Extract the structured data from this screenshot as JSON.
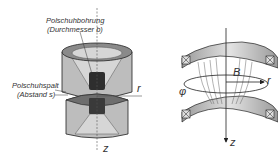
{
  "left_figure": {
    "label_bore_line1": "Polschuhbohrung",
    "label_bore_line2": "(Durchmesser b)",
    "label_gap_line1": "Polschuhspalt",
    "label_gap_line2": "(Abstand s)",
    "axis_r": "r",
    "axis_z": "z"
  },
  "right_figure": {
    "label_B": "B",
    "axis_phi": "φ",
    "axis_r": "r",
    "axis_z": "z"
  },
  "colors": {
    "outer_face": "#bdbdbd",
    "top_face": "#8a8a8a",
    "inner_cone": "#d6d6d6",
    "core": "#2e2e2e",
    "outline": "#222222"
  }
}
